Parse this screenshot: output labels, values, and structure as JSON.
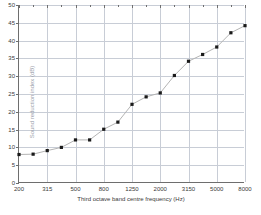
{
  "chart_data": {
    "type": "line",
    "title": "",
    "subtitle": "",
    "xlabel": "Third octave band centre frequency (Hz)",
    "ylabel": "Sound reduction index (dB)",
    "grid": true,
    "legend": false,
    "ylim": [
      0,
      50
    ],
    "yticks": [
      0,
      5,
      10,
      15,
      20,
      25,
      30,
      35,
      40,
      45,
      50
    ],
    "ytick_labels": [
      "0",
      "5",
      "10",
      "15",
      "20",
      "25",
      "30",
      "35",
      "40",
      "45",
      "50"
    ],
    "categories": [
      "200",
      "250",
      "315",
      "400",
      "500",
      "630",
      "800",
      "1000",
      "1250",
      "1600",
      "2000",
      "2500",
      "3150",
      "4000",
      "5000",
      "6300",
      "8000"
    ],
    "xtick_labels": [
      "200",
      "315",
      "500",
      "800",
      "1250",
      "2000",
      "3150",
      "5000",
      "8000"
    ],
    "xtick_label_indices": [
      0,
      2,
      4,
      6,
      8,
      10,
      12,
      14,
      16
    ],
    "values": [
      8.0,
      8.1,
      9.1,
      10.0,
      12.1,
      12.1,
      15.1,
      17.1,
      22.1,
      24.2,
      25.3,
      30.2,
      34.2,
      36.1,
      38.2,
      42.2,
      44.2
    ],
    "marker": "square",
    "marker_color": "#1a1a1a",
    "line_color": "#b4b4b4",
    "grid_color": "#c8cdd6",
    "axis_color": "#6e6e6e",
    "background": "#ffffff"
  }
}
